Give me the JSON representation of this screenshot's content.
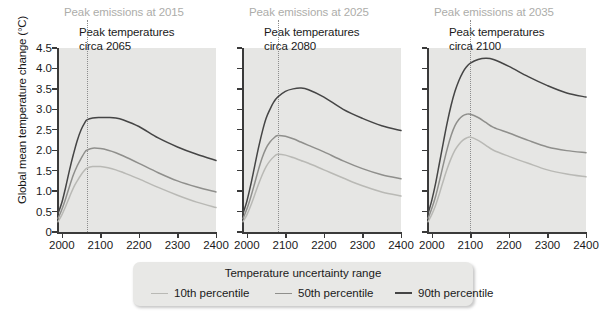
{
  "axes": {
    "ylabel": "Global mean temperature change (°C)",
    "yticks": [
      "0",
      "0.5",
      "1.0",
      "1.5",
      "2.0",
      "2.5",
      "3.0",
      "3.5",
      "4.0",
      "4.5"
    ],
    "ytick_values": [
      0,
      0.5,
      1.0,
      1.5,
      2.0,
      2.5,
      3.0,
      3.5,
      4.0,
      4.5
    ],
    "ylim": [
      0,
      4.5
    ],
    "xticks": [
      "2000",
      "2100",
      "2200",
      "2300",
      "2400"
    ],
    "xtick_values": [
      2000,
      2100,
      2200,
      2300,
      2400
    ],
    "xlim": [
      1990,
      2400
    ]
  },
  "legend": {
    "title": "Temperature uncertainty range",
    "items": [
      {
        "label": "10th percentile",
        "color": "#b9b9b5",
        "width": 1.7
      },
      {
        "label": "50th percentile",
        "color": "#8f8f8c",
        "width": 1.7
      },
      {
        "label": "90th percentile",
        "color": "#454545",
        "width": 1.7
      }
    ]
  },
  "panels": [
    {
      "title": "Peak emissions at 2015",
      "annotation_line1": "Peak temperatures",
      "annotation_line2": "circa 2065",
      "peak_year": 2065
    },
    {
      "title": "Peak emissions at 2025",
      "annotation_line1": "Peak temperatures",
      "annotation_line2": "circa 2080",
      "peak_year": 2080
    },
    {
      "title": "Peak emissions at 2035",
      "annotation_line1": "Peak temperatures",
      "annotation_line2": "circa 2100",
      "peak_year": 2100
    }
  ],
  "chart_data": {
    "type": "line",
    "title": "",
    "xlabel": "",
    "ylabel": "Global mean temperature change (°C)",
    "xlim": [
      1990,
      2400
    ],
    "ylim": [
      0,
      4.5
    ],
    "grid": false,
    "legend_position": "bottom",
    "panels": [
      {
        "panel_title": "Peak emissions at 2015",
        "annotation": "Peak temperatures circa 2065",
        "peak_year": 2065,
        "x": [
          1990,
          2000,
          2010,
          2020,
          2030,
          2040,
          2050,
          2060,
          2065,
          2080,
          2100,
          2120,
          2140,
          2160,
          2200,
          2250,
          2300,
          2350,
          2400
        ],
        "series": [
          {
            "name": "10th percentile",
            "color": "#b9b9b5",
            "values": [
              0.25,
              0.42,
              0.63,
              0.86,
              1.08,
              1.25,
              1.4,
              1.52,
              1.56,
              1.6,
              1.6,
              1.57,
              1.52,
              1.45,
              1.3,
              1.09,
              0.9,
              0.73,
              0.6
            ]
          },
          {
            "name": "50th percentile",
            "color": "#8f8f8c",
            "values": [
              0.33,
              0.55,
              0.82,
              1.12,
              1.4,
              1.62,
              1.8,
              1.96,
              2.0,
              2.05,
              2.04,
              2.0,
              1.94,
              1.86,
              1.68,
              1.45,
              1.25,
              1.1,
              0.98
            ]
          },
          {
            "name": "90th percentile",
            "color": "#454545",
            "values": [
              0.45,
              0.72,
              1.1,
              1.52,
              1.9,
              2.24,
              2.5,
              2.68,
              2.74,
              2.79,
              2.8,
              2.8,
              2.79,
              2.74,
              2.58,
              2.3,
              2.08,
              1.9,
              1.75
            ]
          }
        ]
      },
      {
        "panel_title": "Peak emissions at 2025",
        "annotation": "Peak temperatures circa 2080",
        "peak_year": 2080,
        "x": [
          1990,
          2000,
          2010,
          2020,
          2030,
          2040,
          2050,
          2060,
          2070,
          2080,
          2100,
          2120,
          2140,
          2160,
          2200,
          2250,
          2300,
          2350,
          2400
        ],
        "series": [
          {
            "name": "10th percentile",
            "color": "#b9b9b5",
            "values": [
              0.25,
              0.42,
              0.64,
              0.9,
              1.16,
              1.4,
              1.6,
              1.74,
              1.84,
              1.9,
              1.88,
              1.82,
              1.75,
              1.68,
              1.52,
              1.32,
              1.13,
              0.98,
              0.88
            ]
          },
          {
            "name": "50th percentile",
            "color": "#8f8f8c",
            "values": [
              0.33,
              0.56,
              0.85,
              1.18,
              1.52,
              1.82,
              2.05,
              2.2,
              2.3,
              2.36,
              2.34,
              2.28,
              2.2,
              2.12,
              1.96,
              1.74,
              1.55,
              1.4,
              1.3
            ]
          },
          {
            "name": "90th percentile",
            "color": "#454545",
            "values": [
              0.45,
              0.75,
              1.15,
              1.6,
              2.05,
              2.45,
              2.78,
              3.0,
              3.18,
              3.3,
              3.44,
              3.5,
              3.52,
              3.48,
              3.3,
              3.0,
              2.78,
              2.6,
              2.48
            ]
          }
        ]
      },
      {
        "panel_title": "Peak emissions at 2035",
        "annotation": "Peak temperatures circa 2100",
        "peak_year": 2100,
        "x": [
          1990,
          2000,
          2010,
          2020,
          2030,
          2040,
          2050,
          2060,
          2070,
          2080,
          2090,
          2100,
          2120,
          2140,
          2160,
          2200,
          2250,
          2300,
          2350,
          2400
        ],
        "series": [
          {
            "name": "10th percentile",
            "color": "#b9b9b5",
            "values": [
              0.25,
              0.43,
              0.66,
              0.95,
              1.26,
              1.55,
              1.8,
              2.0,
              2.14,
              2.24,
              2.3,
              2.32,
              2.24,
              2.12,
              2.0,
              1.85,
              1.68,
              1.52,
              1.42,
              1.35
            ]
          },
          {
            "name": "50th percentile",
            "color": "#8f8f8c",
            "values": [
              0.33,
              0.58,
              0.88,
              1.26,
              1.66,
              2.04,
              2.36,
              2.6,
              2.75,
              2.84,
              2.88,
              2.88,
              2.8,
              2.68,
              2.56,
              2.42,
              2.24,
              2.08,
              1.99,
              1.94
            ]
          },
          {
            "name": "90th percentile",
            "color": "#454545",
            "values": [
              0.45,
              0.78,
              1.2,
              1.7,
              2.2,
              2.68,
              3.1,
              3.44,
              3.7,
              3.9,
              4.04,
              4.13,
              4.22,
              4.25,
              4.22,
              4.05,
              3.8,
              3.58,
              3.4,
              3.3
            ]
          }
        ]
      }
    ]
  }
}
